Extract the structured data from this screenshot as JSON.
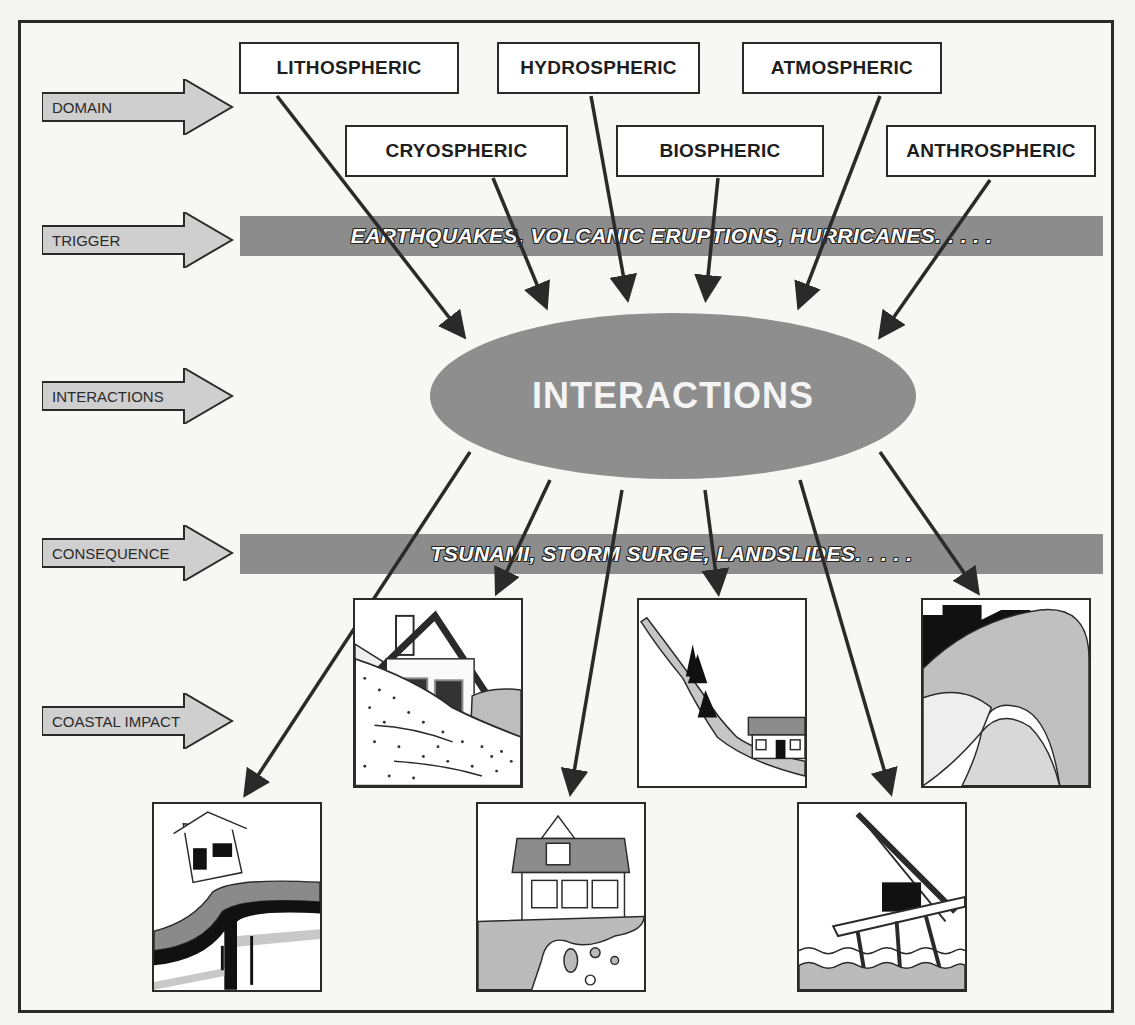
{
  "diagram": {
    "domains": [
      {
        "label": "LITHOSPHERIC"
      },
      {
        "label": "HYDROSPHERIC"
      },
      {
        "label": "ATMOSPHERIC"
      },
      {
        "label": "CRYOSPHERIC"
      },
      {
        "label": "BIOSPHERIC"
      },
      {
        "label": "ANTHROSPHERIC"
      }
    ],
    "rows": [
      {
        "label": "DOMAIN"
      },
      {
        "label": "TRIGGER"
      },
      {
        "label": "INTERACTIONS"
      },
      {
        "label": "CONSEQUENCE"
      },
      {
        "label": "COASTAL IMPACT"
      }
    ],
    "trigger_band": "EARTHQUAKES, VOLCANIC ERUPTIONS, HURRICANES. . . . .",
    "center": "INTERACTIONS",
    "consequence_band": "TSUNAMI, STORM SURGE, LANDSLIDES. . . . .",
    "impact_panels": [
      {
        "name": "earthquake-fault-house"
      },
      {
        "name": "house-on-sliding-slope"
      },
      {
        "name": "cliff-erosion-house"
      },
      {
        "name": "landslide-with-trees-and-house"
      },
      {
        "name": "storm-damaged-offshore-platform"
      },
      {
        "name": "tsunami-wave-over-buildings"
      }
    ],
    "colors": {
      "band_gray": "#8c8c8c",
      "ellipse_gray": "#8e8e8e",
      "arrow_fill": "#cfcfcf",
      "line": "#2a2a2a"
    }
  }
}
